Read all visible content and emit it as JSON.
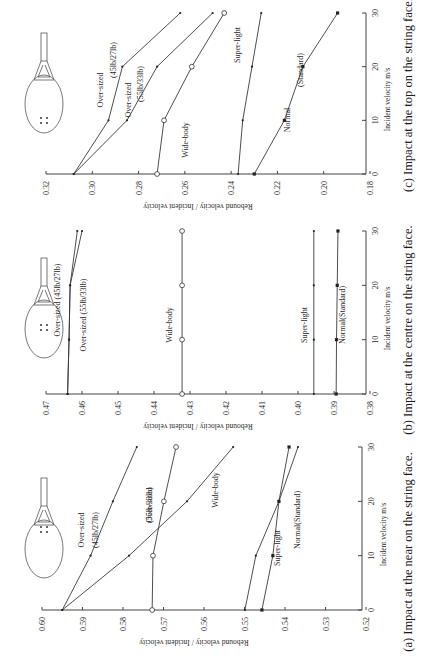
{
  "figure": {
    "orientation": "rotated 90 degrees counter-clockwise",
    "panels": [
      "a",
      "b",
      "c"
    ]
  },
  "chart_data": [
    {
      "id": "c",
      "type": "line",
      "title": "(c) Impact at the top on the string face.",
      "xlabel": "Incident velocity  m/s",
      "ylabel": "Rebound velocity / Incident velocity",
      "x": [
        0,
        10,
        20,
        30
      ],
      "xticks": [
        "0",
        "10",
        "20",
        "30"
      ],
      "ylim": [
        0.18,
        0.32
      ],
      "yticks": [
        "0.32",
        "0.30",
        "0.28",
        "0.26",
        "0.24",
        "0.22",
        "0.20",
        "0.18"
      ],
      "grid": false,
      "series": [
        {
          "name": "Over-sized (45lb/27lb)",
          "label_lines": [
            "Over-sized",
            "(45lb/27lb)"
          ],
          "marker": "dot",
          "values": [
            0.308,
            0.293,
            0.287,
            0.262
          ]
        },
        {
          "name": "Over-sized (55lb/33lb)",
          "label_lines": [
            "Over-sized",
            "(55lb/33lb)"
          ],
          "marker": "dot",
          "values": [
            0.308,
            0.285,
            0.272,
            0.248
          ]
        },
        {
          "name": "Wide-body",
          "label_lines": [
            "Wide-body"
          ],
          "marker": "circle",
          "values": [
            0.272,
            0.269,
            0.257,
            0.243
          ]
        },
        {
          "name": "Super-light",
          "label_lines": [
            "Super-light"
          ],
          "marker": "dot",
          "values": [
            0.237,
            0.235,
            0.231,
            0.227
          ]
        },
        {
          "name": "Normal (Standard)",
          "label_lines": [
            "Normal",
            "(Standard)"
          ],
          "marker": "square",
          "values": [
            0.23,
            0.217,
            0.209,
            0.194
          ]
        }
      ]
    },
    {
      "id": "b",
      "type": "line",
      "title": "(b) Impact at the centre on the string face.",
      "xlabel": "Incident velocity  m/s",
      "ylabel": "Rebound velocity / Incident velocity",
      "x": [
        0,
        10,
        20,
        30
      ],
      "xticks": [
        "0",
        "10",
        "20",
        "30"
      ],
      "ylim": [
        0.38,
        0.47
      ],
      "yticks": [
        "0.47",
        "0.46",
        "0.45",
        "0.44",
        "0.43",
        "0.42",
        "0.41",
        "0.40",
        "0.39",
        "0.38"
      ],
      "grid": false,
      "series": [
        {
          "name": "Over-sized (45lb/27lb)",
          "label_lines": [
            "Over-sized (45lb/27lb)"
          ],
          "marker": "dot",
          "values": [
            0.464,
            0.4636,
            0.4633,
            0.4613
          ]
        },
        {
          "name": "Over-sized (55lb/33lb)",
          "label_lines": [
            "Over-sized (55lb/33lb)"
          ],
          "marker": "dot",
          "values": [
            0.464,
            0.4636,
            0.4633,
            0.46
          ]
        },
        {
          "name": "Wide-body",
          "label_lines": [
            "Wide-body"
          ],
          "marker": "circle",
          "values": [
            0.4322,
            0.4322,
            0.4322,
            0.4322
          ]
        },
        {
          "name": "Super-light",
          "label_lines": [
            "Super-light"
          ],
          "marker": "dot",
          "values": [
            0.3956,
            0.3956,
            0.3956,
            0.3956
          ]
        },
        {
          "name": "Normal (Standard)",
          "label_lines": [
            "Normal(Standard)"
          ],
          "marker": "square",
          "values": [
            0.3894,
            0.3893,
            0.3891,
            0.3889
          ]
        }
      ]
    },
    {
      "id": "a",
      "type": "line",
      "title": "(a) Impact at the near on the string face.",
      "xlabel": "Incident velocity  m/s",
      "ylabel": "Rebound velocity / Incident velocity",
      "x": [
        0,
        10,
        20,
        30
      ],
      "xticks": [
        "0",
        "10",
        "20",
        "30"
      ],
      "ylim": [
        0.52,
        0.6
      ],
      "yticks": [
        "0.60",
        "0.59",
        "0.58",
        "0.57",
        "0.56",
        "0.55",
        "0.54",
        "0.53",
        "0.52"
      ],
      "grid": false,
      "series": [
        {
          "name": "Over-sized (45lb/27lb)",
          "label_lines": [
            "Over-sized",
            "(45lb/27lb)"
          ],
          "marker": "dot",
          "values": [
            0.595,
            0.588,
            0.5825,
            0.5766
          ]
        },
        {
          "name": "Over-sized (55lb/33lb)",
          "label_lines": [
            "Over-sized",
            "(55lb/33lb)"
          ],
          "marker": "dot",
          "values": [
            0.595,
            0.5785,
            0.5642,
            0.5528
          ]
        },
        {
          "name": "Wide-body",
          "label_lines": [
            "Wide-body"
          ],
          "marker": "circle",
          "values": [
            0.5728,
            0.5726,
            0.5699,
            0.5669
          ]
        },
        {
          "name": "Super-light",
          "label_lines": [
            "Super-light"
          ],
          "marker": "dot",
          "values": [
            0.5499,
            0.5472,
            0.5415,
            0.5368
          ]
        },
        {
          "name": "Normal (Standard)",
          "label_lines": [
            "Normal(Standard)"
          ],
          "marker": "square",
          "values": [
            0.5457,
            0.543,
            0.5415,
            0.539
          ]
        }
      ]
    }
  ]
}
